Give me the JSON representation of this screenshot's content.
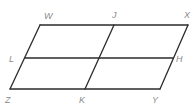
{
  "diagram": {
    "type": "parallelogram-subdivided",
    "colors": {
      "line": "#2b2b2b",
      "label": "#8a8a8a",
      "background": "#ffffff"
    },
    "vertices": {
      "W": {
        "x": 40,
        "y": 25
      },
      "J": {
        "x": 114,
        "y": 25
      },
      "X": {
        "x": 188,
        "y": 25
      },
      "L": {
        "x": 25,
        "y": 58
      },
      "H": {
        "x": 173,
        "y": 58
      },
      "Z": {
        "x": 10,
        "y": 89
      },
      "K": {
        "x": 85,
        "y": 89
      },
      "Y": {
        "x": 160,
        "y": 89
      }
    },
    "labels": [
      {
        "text": "W",
        "x": 44,
        "y": 19
      },
      {
        "text": "J",
        "x": 112,
        "y": 18
      },
      {
        "text": "X",
        "x": 184,
        "y": 18
      },
      {
        "text": "L",
        "x": 9,
        "y": 62
      },
      {
        "text": "H",
        "x": 176,
        "y": 62
      },
      {
        "text": "Z",
        "x": 5,
        "y": 103
      },
      {
        "text": "K",
        "x": 79,
        "y": 103
      },
      {
        "text": "Y",
        "x": 152,
        "y": 103
      }
    ],
    "segments": [
      {
        "name": "WX",
        "from": "W",
        "to": "X"
      },
      {
        "name": "XY",
        "from": "X",
        "to": "Y"
      },
      {
        "name": "YZ",
        "from": "Y",
        "to": "Z"
      },
      {
        "name": "ZW",
        "from": "Z",
        "to": "W"
      },
      {
        "name": "LH",
        "from": "L",
        "to": "H"
      },
      {
        "name": "JK",
        "from": "J",
        "to": "K"
      }
    ]
  }
}
